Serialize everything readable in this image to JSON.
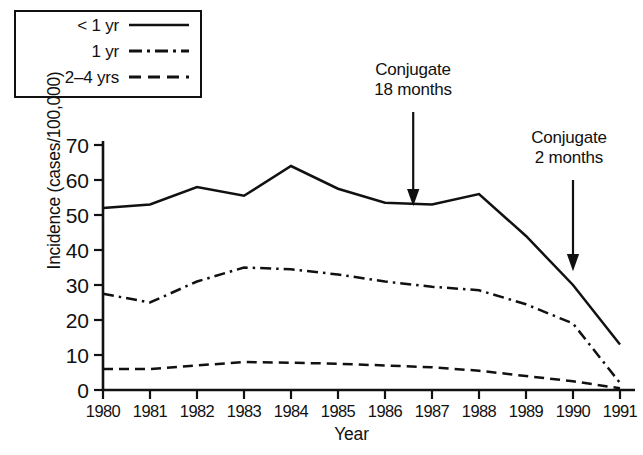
{
  "chart_data": {
    "type": "line",
    "title": "",
    "xlabel": "Year",
    "ylabel": "Incidence (cases/100,000)",
    "categories": [
      "1980",
      "1981",
      "1982",
      "1983",
      "1984",
      "1985",
      "1986",
      "1987",
      "1988",
      "1989",
      "1990",
      "1991"
    ],
    "x": [
      1980,
      1981,
      1982,
      1983,
      1984,
      1985,
      1986,
      1987,
      1988,
      1989,
      1990,
      1991
    ],
    "xlim": [
      1980,
      1991
    ],
    "ylim": [
      0,
      70
    ],
    "yticks": [
      0,
      10,
      20,
      30,
      40,
      50,
      60,
      70
    ],
    "ytick_labels": [
      "0",
      "10",
      "20",
      "30",
      "40",
      "50",
      "60",
      "70"
    ],
    "grid": false,
    "legend_position": "top-left",
    "series": [
      {
        "name": "< 1 yr",
        "style": "solid",
        "values": [
          52,
          53,
          58,
          55.5,
          64,
          57.5,
          53.5,
          53,
          56,
          44,
          30,
          13
        ]
      },
      {
        "name": "1 yr",
        "style": "dash-dot",
        "values": [
          27.5,
          25,
          31,
          35,
          34.5,
          33,
          31,
          29.5,
          28.5,
          24.5,
          19,
          2
        ]
      },
      {
        "name": "2–4 yrs",
        "style": "dashed",
        "values": [
          6,
          6,
          7,
          8,
          7.8,
          7.5,
          7,
          6.5,
          5.5,
          4,
          2.5,
          0.5
        ]
      }
    ],
    "annotations": [
      {
        "id": "conjugate-18-months",
        "line1": "Conjugate",
        "line2": "18 months",
        "x_value": 1986.6,
        "arrow": "down"
      },
      {
        "id": "conjugate-2-months",
        "line1": "Conjugate",
        "line2": "2 months",
        "x_value": 1990.0,
        "arrow": "down"
      }
    ]
  },
  "legend": {
    "items": [
      {
        "label": "< 1 yr",
        "key": "solid-line-key"
      },
      {
        "label": "1 yr",
        "key": "dash-dot-line-key"
      },
      {
        "label": "2–4 yrs",
        "key": "dashed-line-key"
      }
    ]
  },
  "axes": {
    "y_title": "Incidence (cases/100,000)",
    "x_title": "Year"
  },
  "colors": {
    "ink": "#111111",
    "background": "#ffffff"
  }
}
